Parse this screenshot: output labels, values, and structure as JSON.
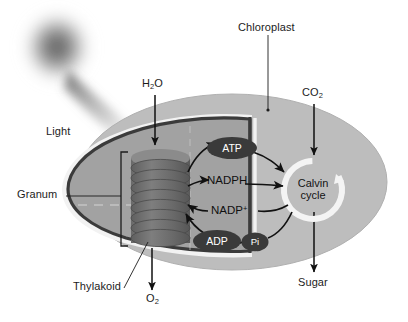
{
  "diagram": {
    "colors": {
      "chloroplast_body": "#b9b9b9",
      "stroma_inner": "#9d9d9d",
      "membrane_dark": "#3b3b3b",
      "membrane_white": "#f2f2f2",
      "granum_disc": "#6e6e6e",
      "node_fill": "#3a3a3a",
      "node_text": "#ffffff",
      "arrow": "#111111",
      "calvin_ring": "#f4f4f4",
      "light_glow": "#595959",
      "label_text": "#1c1c1c"
    },
    "labels": {
      "chloroplast": "Chloroplast",
      "light": "Light",
      "granum": "Granum",
      "thylakoid": "Thylakoid",
      "water": "H",
      "water_sub": "2",
      "water_tail": "O",
      "oxygen": "O",
      "oxygen_sub": "2",
      "carbon_dioxide": "CO",
      "carbon_dioxide_sub": "2",
      "sugar": "Sugar"
    },
    "nodes": {
      "atp": "ATP",
      "adp": "ADP",
      "pi": "Pi",
      "nadph": "NADPH",
      "nadp": "NADP",
      "nadp_sup": "+",
      "calvin_line1": "Calvin",
      "calvin_line2": "cycle"
    },
    "structure": {
      "granum_disc_count": 8,
      "inputs": [
        "H2O",
        "CO2",
        "Light"
      ],
      "outputs": [
        "O2",
        "Sugar"
      ],
      "carriers_forward": [
        "ATP",
        "NADPH"
      ],
      "carriers_return": [
        "NADP+",
        "ADP",
        "Pi"
      ]
    }
  }
}
